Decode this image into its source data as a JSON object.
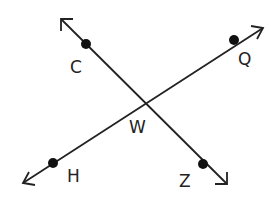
{
  "diagram": {
    "type": "intersecting-lines",
    "colors": {
      "stroke": "#222222",
      "point": "#111111",
      "background": "#ffffff"
    },
    "lines": [
      {
        "name": "line-CZ",
        "through": [
          "C",
          "W",
          "Z"
        ],
        "from": [
          61,
          19
        ],
        "to": [
          227,
          184
        ]
      },
      {
        "name": "line-HQ",
        "through": [
          "H",
          "W",
          "Q"
        ],
        "from": [
          23,
          183
        ],
        "to": [
          263,
          28
        ]
      }
    ],
    "points": {
      "C": {
        "label": "C",
        "x": 86,
        "y": 44,
        "label_x": 70,
        "label_y": 73
      },
      "Q": {
        "label": "Q",
        "x": 234,
        "y": 40,
        "label_x": 238,
        "label_y": 65
      },
      "W": {
        "label": "W",
        "x": 142,
        "y": 102,
        "label_x": 129,
        "label_y": 133
      },
      "H": {
        "label": "H",
        "x": 53,
        "y": 163,
        "label_x": 67,
        "label_y": 182
      },
      "Z": {
        "label": "Z",
        "x": 203,
        "y": 164,
        "label_x": 179,
        "label_y": 187
      }
    }
  }
}
